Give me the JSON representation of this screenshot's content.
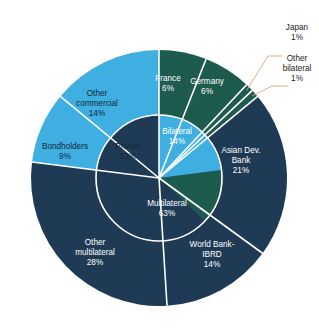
{
  "chart_data": {
    "type": "pie",
    "title": "",
    "subtitle": "",
    "xlabel": "",
    "ylabel": "",
    "legend_position": "none",
    "grid": false,
    "variant": "nested-donut",
    "units": "percent",
    "start_angle_deg": -90,
    "direction": "clockwise",
    "rings": [
      {
        "name": "inner",
        "categories": [
          "Private",
          "Bilateral",
          "Multilateral"
        ],
        "values": [
          23,
          14,
          63
        ]
      },
      {
        "name": "outer",
        "categories": [
          "France",
          "Germany",
          "Japan",
          "Other bilateral",
          "Asian Dev. Bank",
          "World Bank-IBRD",
          "Other multilateral",
          "Bondholders",
          "Other commercial"
        ],
        "values": [
          6,
          6,
          1,
          1,
          21,
          14,
          28,
          9,
          14
        ]
      }
    ],
    "colors": {
      "private": "#3FAEE0",
      "bilateral": "#1E5B4F",
      "multilateral": "#1E3A54",
      "separator": "#ffffff",
      "leader_line": "#d8a878",
      "background": "#ffffff",
      "label_on_light": "#14293c",
      "label_on_dark": "#ffffff",
      "callout_text": "#1a1a1a"
    }
  },
  "labels": {
    "other_commercial": {
      "name": "Other",
      "name2": "commercial",
      "pct": "14%"
    },
    "bondholders": {
      "name": "Bondholders",
      "pct": "9%"
    },
    "private": {
      "name": "Private",
      "pct": "23%"
    },
    "france": {
      "name": "France",
      "pct": "6%"
    },
    "germany": {
      "name": "Germany",
      "pct": "6%"
    },
    "bilateral": {
      "name": "Bilateral",
      "pct": "14%"
    },
    "asian_dev_bank": {
      "name": "Asian Dev.",
      "name2": "Bank",
      "pct": "21%"
    },
    "multilateral": {
      "name": "Multilateral",
      "pct": "63%"
    },
    "world_bank": {
      "name": "World Bank-",
      "name2": "IBRD",
      "pct": "14%"
    },
    "other_multilateral": {
      "name": "Other",
      "name2": "multilateral",
      "pct": "28%"
    }
  },
  "callouts": {
    "japan": {
      "name": "Japan",
      "pct": "1%"
    },
    "other_bilateral": {
      "name": "Other",
      "name2": "bilateral",
      "pct": "1%"
    }
  }
}
